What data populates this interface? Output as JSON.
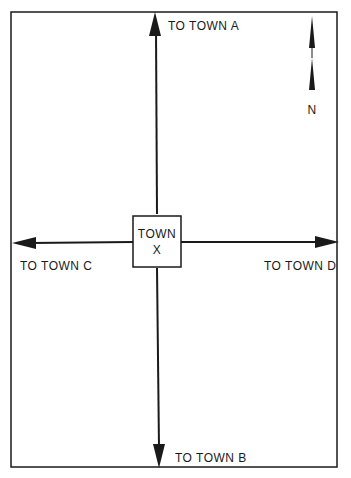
{
  "diagram": {
    "center_town": {
      "line1": "TOWN",
      "line2": "X"
    },
    "roads": {
      "north": "TO TOWN A",
      "south": "TO TOWN B",
      "west": "TO TOWN C",
      "east": "TO TOWN D"
    },
    "compass": {
      "label": "N"
    },
    "colors": {
      "ink": "#1a1a1a",
      "background": "#ffffff"
    }
  }
}
